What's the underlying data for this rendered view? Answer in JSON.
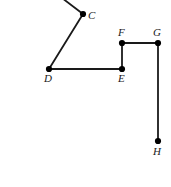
{
  "figure": {
    "type": "geometry-polyline-diagram",
    "width": 171,
    "height": 187,
    "background_color": "#ffffff",
    "stroke_color": "#1a1a1a",
    "stroke_width": 1.8,
    "vertex_color": "#000000",
    "vertex_radius": 3.1,
    "label_color": "#1a1a1a",
    "label_font_size": 11,
    "label_style": "italic-serif"
  },
  "points": [
    {
      "id": "A_offscreen",
      "label": "",
      "x": 62,
      "y": -2,
      "dot": false,
      "label_x": 0,
      "label_y": 0
    },
    {
      "id": "C",
      "label": "C",
      "x": 83,
      "y": 14,
      "dot": true,
      "label_x": 88,
      "label_y": 10
    },
    {
      "id": "D",
      "label": "D",
      "x": 49,
      "y": 69,
      "dot": true,
      "label_x": 44,
      "label_y": 73
    },
    {
      "id": "E",
      "label": "E",
      "x": 122,
      "y": 69,
      "dot": true,
      "label_x": 118,
      "label_y": 73
    },
    {
      "id": "F",
      "label": "F",
      "x": 122,
      "y": 43,
      "dot": true,
      "label_x": 118,
      "label_y": 27
    },
    {
      "id": "G",
      "label": "G",
      "x": 158,
      "y": 43,
      "dot": true,
      "label_x": 153,
      "label_y": 27
    },
    {
      "id": "H",
      "label": "H",
      "x": 158,
      "y": 141,
      "dot": true,
      "label_x": 153,
      "label_y": 146
    }
  ],
  "segments": [
    {
      "id": "seg-top-to-C",
      "from": "A_offscreen",
      "to": "C"
    },
    {
      "id": "seg-C-D",
      "from": "C",
      "to": "D"
    },
    {
      "id": "seg-D-E",
      "from": "D",
      "to": "E"
    },
    {
      "id": "seg-E-F",
      "from": "E",
      "to": "F"
    },
    {
      "id": "seg-F-G",
      "from": "F",
      "to": "G"
    },
    {
      "id": "seg-G-H",
      "from": "G",
      "to": "H"
    }
  ]
}
